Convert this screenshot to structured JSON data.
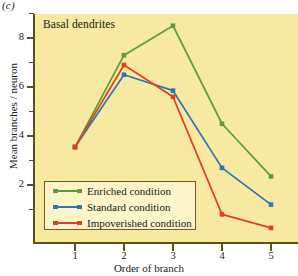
{
  "panel": {
    "label": "(c)"
  },
  "chart_data": {
    "type": "line",
    "title": "Basal dendrites",
    "xlabel": "Order of branch",
    "ylabel": "Mean branches / neuron",
    "x": [
      1,
      2,
      3,
      4,
      5
    ],
    "xtick_labels": [
      "1",
      "2",
      "3",
      "4",
      "5"
    ],
    "ytick_labels": [
      "2",
      "4",
      "6",
      "8"
    ],
    "ytick_values": [
      2,
      4,
      6,
      8
    ],
    "yminor_values": [
      1,
      3,
      5,
      7,
      9
    ],
    "xlim": [
      0.5,
      5.5
    ],
    "ylim": [
      0,
      9.2
    ],
    "grid": false,
    "legend_position": "lower-left-inside",
    "series": [
      {
        "name": "Enriched condition",
        "color": "#5a9e3a",
        "values": [
          3.55,
          7.3,
          8.5,
          4.5,
          2.35
        ]
      },
      {
        "name": "Standard condition",
        "color": "#2d76b5",
        "values": [
          3.55,
          6.5,
          5.85,
          2.7,
          1.2
        ]
      },
      {
        "name": "Impoverished condition",
        "color": "#e0402b",
        "values": [
          3.55,
          6.9,
          5.6,
          0.8,
          0.25
        ]
      }
    ]
  },
  "colors": {
    "plot_background": "#f7e9a0",
    "legend_background": "#fdf4c8",
    "axis": "#5c4f20",
    "text": "#1a1a1a"
  }
}
